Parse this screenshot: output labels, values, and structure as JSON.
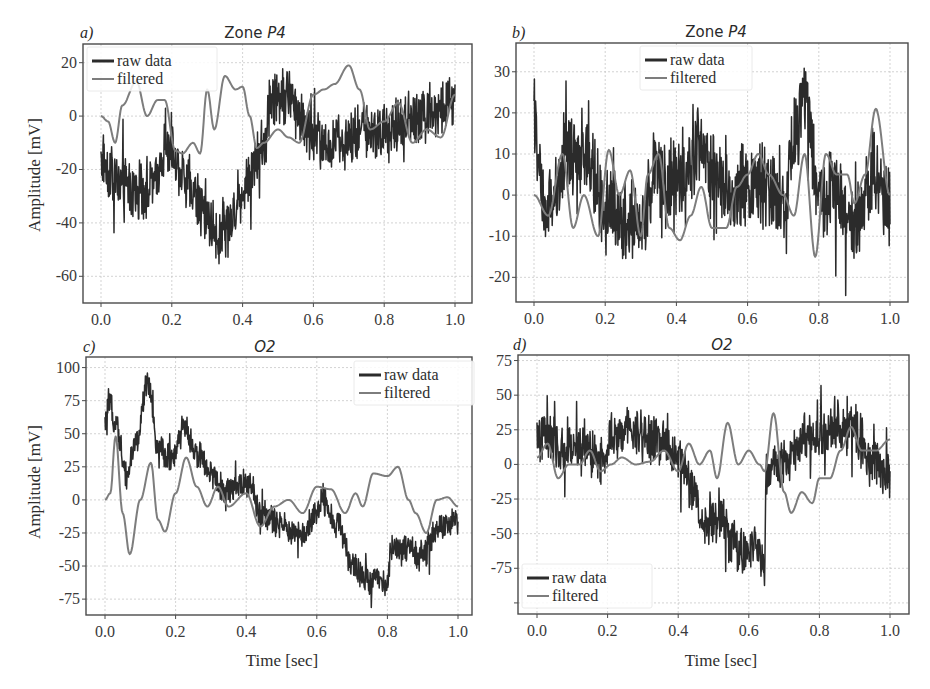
{
  "colors": {
    "raw": "#2b2b2b",
    "filtered": "#7d7d7d",
    "frame": "#4a4a4a",
    "grid": "#c8c8c8"
  },
  "legend": {
    "raw_label": "raw data",
    "filtered_label": "filtered"
  },
  "chart_data": [
    {
      "id": "a",
      "type": "line",
      "panel_letter": "a)",
      "title": "Zone P4",
      "xlabel": "",
      "ylabel": "Amplitude [mV]",
      "xlim": [
        -0.03,
        1.03
      ],
      "ylim": [
        -70,
        27
      ],
      "xticks": [
        0.0,
        0.2,
        0.4,
        0.6,
        0.8,
        1.0
      ],
      "xtick_labels": [
        "0.0",
        "0.2",
        "0.4",
        "0.6",
        "0.8",
        "1.0"
      ],
      "yticks": [
        20,
        0,
        -20,
        -40,
        -60
      ],
      "ytick_labels": [
        "20",
        "0",
        "-20",
        "-40",
        "-60"
      ],
      "grid": true,
      "legend_position": "upper left",
      "box": {
        "left": 83,
        "top": 44,
        "right": 472,
        "bottom": 303,
        "x0px": 101,
        "x1px": 455
      },
      "series": [
        {
          "name": "raw data",
          "noise": 9,
          "x": [
            0.0,
            0.02,
            0.05,
            0.1,
            0.15,
            0.18,
            0.2,
            0.25,
            0.3,
            0.33,
            0.36,
            0.4,
            0.44,
            0.46,
            0.48,
            0.52,
            0.56,
            0.6,
            0.65,
            0.7,
            0.75,
            0.8,
            0.85,
            0.9,
            0.95,
            1.0
          ],
          "y": [
            -15,
            -20,
            -25,
            -28,
            -25,
            -12,
            -15,
            -25,
            -38,
            -45,
            -40,
            -28,
            -15,
            -12,
            8,
            8,
            2,
            -8,
            -12,
            -8,
            -5,
            -5,
            -2,
            0,
            2,
            6
          ]
        },
        {
          "name": "filtered",
          "noise": 0,
          "x": [
            0.0,
            0.02,
            0.04,
            0.06,
            0.1,
            0.13,
            0.16,
            0.18,
            0.21,
            0.23,
            0.26,
            0.28,
            0.3,
            0.32,
            0.35,
            0.38,
            0.4,
            0.42,
            0.44,
            0.46,
            0.5,
            0.53,
            0.56,
            0.6,
            0.63,
            0.66,
            0.7,
            0.73,
            0.76,
            0.8,
            0.84,
            0.88,
            0.92,
            0.96,
            1.0
          ],
          "y": [
            0,
            -2,
            -10,
            4,
            13,
            0,
            6,
            6,
            -13,
            -14,
            -10,
            -14,
            10,
            -5,
            15,
            10,
            11,
            0,
            -12,
            -10,
            -5,
            -8,
            -10,
            8,
            10,
            12,
            19,
            10,
            -5,
            -2,
            5,
            -10,
            -5,
            -8,
            8
          ]
        }
      ]
    },
    {
      "id": "b",
      "type": "line",
      "panel_letter": "b)",
      "title": "Zone P4",
      "xlabel": "",
      "ylabel": "",
      "xlim": [
        -0.05,
        1.05
      ],
      "ylim": [
        -26,
        37
      ],
      "xticks": [
        0.0,
        0.2,
        0.4,
        0.6,
        0.8,
        1.0
      ],
      "xtick_labels": [
        "0.0",
        "0.2",
        "0.4",
        "0.6",
        "0.8",
        "1.0"
      ],
      "yticks": [
        30,
        20,
        10,
        0,
        -10,
        -20
      ],
      "ytick_labels": [
        "30",
        "20",
        "10",
        "0",
        "-10",
        "-20"
      ],
      "grid": true,
      "legend_position": "upper center",
      "box": {
        "left": 516,
        "top": 43,
        "right": 908,
        "bottom": 302,
        "x0px": 534,
        "x1px": 890
      },
      "series": [
        {
          "name": "raw data",
          "noise": 8,
          "x": [
            0.0,
            0.01,
            0.03,
            0.06,
            0.1,
            0.15,
            0.2,
            0.25,
            0.3,
            0.34,
            0.38,
            0.42,
            0.46,
            0.5,
            0.55,
            0.6,
            0.65,
            0.7,
            0.74,
            0.76,
            0.8,
            0.85,
            0.9,
            0.95,
            1.0
          ],
          "y": [
            22,
            8,
            -5,
            0,
            10,
            8,
            -2,
            -4,
            -8,
            6,
            4,
            2,
            12,
            5,
            0,
            3,
            2,
            -2,
            15,
            25,
            0,
            2,
            -8,
            5,
            -2
          ]
        },
        {
          "name": "filtered",
          "noise": 0,
          "x": [
            0.0,
            0.04,
            0.08,
            0.11,
            0.14,
            0.18,
            0.21,
            0.24,
            0.27,
            0.3,
            0.32,
            0.35,
            0.38,
            0.41,
            0.44,
            0.47,
            0.5,
            0.54,
            0.57,
            0.6,
            0.63,
            0.66,
            0.7,
            0.73,
            0.76,
            0.79,
            0.82,
            0.85,
            0.88,
            0.9,
            0.93,
            0.96,
            1.0
          ],
          "y": [
            0,
            -5,
            10,
            -8,
            0,
            -10,
            11,
            0,
            6,
            -10,
            5,
            10,
            -8,
            -11,
            -5,
            2,
            -8,
            -8,
            2,
            5,
            10,
            5,
            0,
            -5,
            10,
            -15,
            10,
            5,
            5,
            -2,
            5,
            21,
            0
          ]
        }
      ]
    },
    {
      "id": "c",
      "type": "line",
      "panel_letter": "c)",
      "title": "O2",
      "xlabel": "Time [sec]",
      "ylabel": "Amplitude [mV]",
      "xlim": [
        -0.05,
        1.05
      ],
      "ylim": [
        -87,
        108
      ],
      "xticks": [
        0.0,
        0.2,
        0.4,
        0.6,
        0.8,
        1.0
      ],
      "xtick_labels": [
        "0.0",
        "0.2",
        "0.4",
        "0.6",
        "0.8",
        "1.0"
      ],
      "yticks": [
        100,
        75,
        50,
        25,
        0,
        -25,
        -50,
        -75
      ],
      "ytick_labels": [
        "100",
        "75",
        "50",
        "25",
        "0",
        "-25",
        "-50",
        "-75"
      ],
      "grid": true,
      "legend_position": "upper right",
      "box": {
        "left": 86,
        "top": 357,
        "right": 472,
        "bottom": 615,
        "x0px": 105,
        "x1px": 458
      },
      "series": [
        {
          "name": "raw data",
          "noise": 9,
          "x": [
            0.0,
            0.01,
            0.03,
            0.06,
            0.09,
            0.12,
            0.15,
            0.19,
            0.22,
            0.26,
            0.3,
            0.34,
            0.38,
            0.41,
            0.44,
            0.5,
            0.56,
            0.6,
            0.62,
            0.66,
            0.7,
            0.75,
            0.8,
            0.81,
            0.85,
            0.9,
            0.95,
            1.0
          ],
          "y": [
            55,
            72,
            60,
            20,
            45,
            88,
            40,
            30,
            55,
            35,
            20,
            5,
            12,
            10,
            -10,
            -20,
            -25,
            -10,
            0,
            -20,
            -50,
            -60,
            -62,
            -35,
            -38,
            -40,
            -20,
            -18
          ]
        },
        {
          "name": "filtered",
          "noise": 0,
          "x": [
            0.0,
            0.015,
            0.03,
            0.05,
            0.07,
            0.1,
            0.13,
            0.15,
            0.17,
            0.2,
            0.23,
            0.26,
            0.29,
            0.32,
            0.35,
            0.4,
            0.44,
            0.48,
            0.52,
            0.56,
            0.6,
            0.64,
            0.68,
            0.71,
            0.73,
            0.76,
            0.8,
            0.83,
            0.86,
            0.88,
            0.91,
            0.94,
            0.97,
            1.0
          ],
          "y": [
            0,
            5,
            48,
            -10,
            -41,
            0,
            28,
            -15,
            -24,
            5,
            32,
            10,
            -5,
            10,
            -5,
            5,
            -20,
            -5,
            0,
            -10,
            10,
            8,
            -10,
            5,
            -5,
            20,
            18,
            25,
            0,
            -10,
            -25,
            0,
            2,
            -5
          ]
        }
      ]
    },
    {
      "id": "d",
      "type": "line",
      "panel_letter": "d)",
      "title": "O2",
      "xlabel": "Time [sec]",
      "ylabel": "",
      "xlim": [
        -0.05,
        1.05
      ],
      "ylim": [
        -108,
        79
      ],
      "xticks": [
        0.0,
        0.2,
        0.4,
        0.6,
        0.8,
        1.0
      ],
      "xtick_labels": [
        "0.0",
        "0.2",
        "0.4",
        "0.6",
        "0.8",
        "1.0"
      ],
      "yticks": [
        75,
        50,
        25,
        0,
        -25,
        -50,
        -75,
        -100
      ],
      "ytick_labels": [
        "75",
        "50",
        "25",
        "0",
        "-25",
        "-50",
        "-75",
        ""
      ],
      "grid": true,
      "legend_position": "lower left",
      "box": {
        "left": 518,
        "top": 355,
        "right": 909,
        "bottom": 614,
        "x0px": 537,
        "x1px": 890
      },
      "series": [
        {
          "name": "raw data",
          "noise": 14,
          "x": [
            0.0,
            0.03,
            0.07,
            0.12,
            0.18,
            0.22,
            0.26,
            0.3,
            0.36,
            0.4,
            0.44,
            0.48,
            0.52,
            0.55,
            0.58,
            0.62,
            0.645,
            0.65,
            0.68,
            0.72,
            0.76,
            0.8,
            0.85,
            0.9,
            0.95,
            1.0
          ],
          "y": [
            20,
            20,
            10,
            15,
            5,
            20,
            25,
            20,
            15,
            5,
            -20,
            -45,
            -40,
            -55,
            -65,
            -60,
            -70,
            -5,
            0,
            5,
            20,
            20,
            25,
            25,
            0,
            -5
          ]
        },
        {
          "name": "filtered",
          "noise": 0,
          "x": [
            0.0,
            0.03,
            0.06,
            0.09,
            0.12,
            0.15,
            0.18,
            0.21,
            0.24,
            0.28,
            0.32,
            0.36,
            0.4,
            0.43,
            0.46,
            0.49,
            0.51,
            0.54,
            0.57,
            0.6,
            0.63,
            0.645,
            0.67,
            0.7,
            0.72,
            0.75,
            0.78,
            0.8,
            0.83,
            0.86,
            0.89,
            0.92,
            0.96,
            1.0
          ],
          "y": [
            5,
            15,
            -10,
            0,
            0,
            10,
            -5,
            0,
            5,
            0,
            2,
            10,
            -5,
            15,
            0,
            10,
            -10,
            30,
            0,
            10,
            0,
            -5,
            37,
            -20,
            -35,
            -20,
            -28,
            -10,
            -10,
            10,
            27,
            10,
            10,
            18
          ]
        }
      ]
    }
  ],
  "panels_text": {
    "a": {
      "letter": "a)",
      "title_prefix": "Zone ",
      "title_italic": "P4",
      "ylabel": "Amplitude [mV]"
    },
    "b": {
      "letter": "b)",
      "title_prefix": "Zone ",
      "title_italic": "P4"
    },
    "c": {
      "letter": "c)",
      "title_prefix": "",
      "title_italic": "O2",
      "ylabel": "Amplitude [mV]",
      "xlabel": "Time [sec]"
    },
    "d": {
      "letter": "d)",
      "title_prefix": "",
      "title_italic": "O2",
      "xlabel": "Time [sec]"
    }
  }
}
